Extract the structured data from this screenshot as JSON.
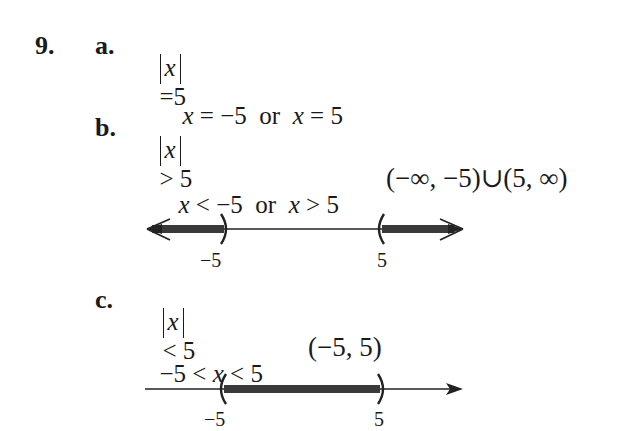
{
  "problem": {
    "number": "9.",
    "parts": [
      {
        "label": "a.",
        "statement": {
          "abs_var": "x",
          "op": "=",
          "rhs": "5"
        },
        "solution": {
          "x1": "x",
          "op1": "=",
          "v1": "−5",
          "conj": "or",
          "x2": "x",
          "op2": "=",
          "v2": "5"
        }
      },
      {
        "label": "b.",
        "statement": {
          "abs_var": "x",
          "op": ">",
          "rhs": "5"
        },
        "solution": {
          "x1": "x",
          "op1": "<",
          "v1": "−5",
          "conj": "or",
          "x2": "x",
          "op2": ">",
          "v2": "5"
        },
        "interval": "(−∞, −5)∪(5, ∞)",
        "number_line": {
          "left_label": "−5",
          "right_label": "5",
          "shaded": "outside",
          "left_bracket": ")",
          "right_bracket": "("
        }
      },
      {
        "label": "c.",
        "statement": {
          "abs_var": "x",
          "op": "<",
          "rhs": "5"
        },
        "solution": {
          "lhs": "−5",
          "op1": "<",
          "x": "x",
          "op2": "<",
          "rhs": "5"
        },
        "interval": "(−5, 5)",
        "number_line": {
          "left_label": "−5",
          "right_label": "5",
          "shaded": "inside",
          "left_bracket": "(",
          "right_bracket": ")"
        }
      }
    ]
  }
}
